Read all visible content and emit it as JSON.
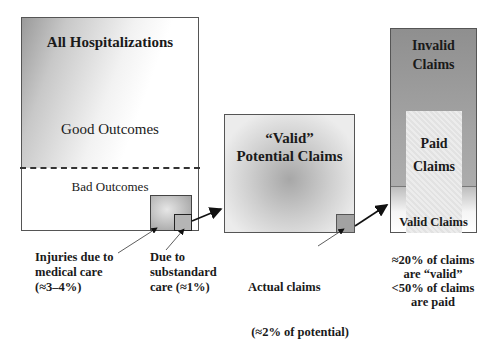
{
  "diagram": {
    "hospitalizations": {
      "title": "All Hospitalizations",
      "good_outcomes": "Good Outcomes",
      "bad_outcomes": "Bad Outcomes"
    },
    "potential_claims": {
      "title_line1": "“Valid”",
      "title_line2": "Potential Claims"
    },
    "claims": {
      "invalid_line1": "Invalid",
      "invalid_line2": "Claims",
      "paid_line1": "Paid",
      "paid_line2": "Claims",
      "valid": "Valid Claims"
    },
    "annotations": {
      "injuries": [
        "Injuries due to",
        "medical care",
        "(≈3–4%)"
      ],
      "substandard": [
        "Due to",
        "substandard",
        "care (≈1%)"
      ],
      "actual": [
        "Actual claims",
        " (≈2% of potential)"
      ],
      "claims_stats": [
        "≈20% of claims",
        "are “valid”",
        "<50% of claims",
        "are paid"
      ]
    }
  }
}
